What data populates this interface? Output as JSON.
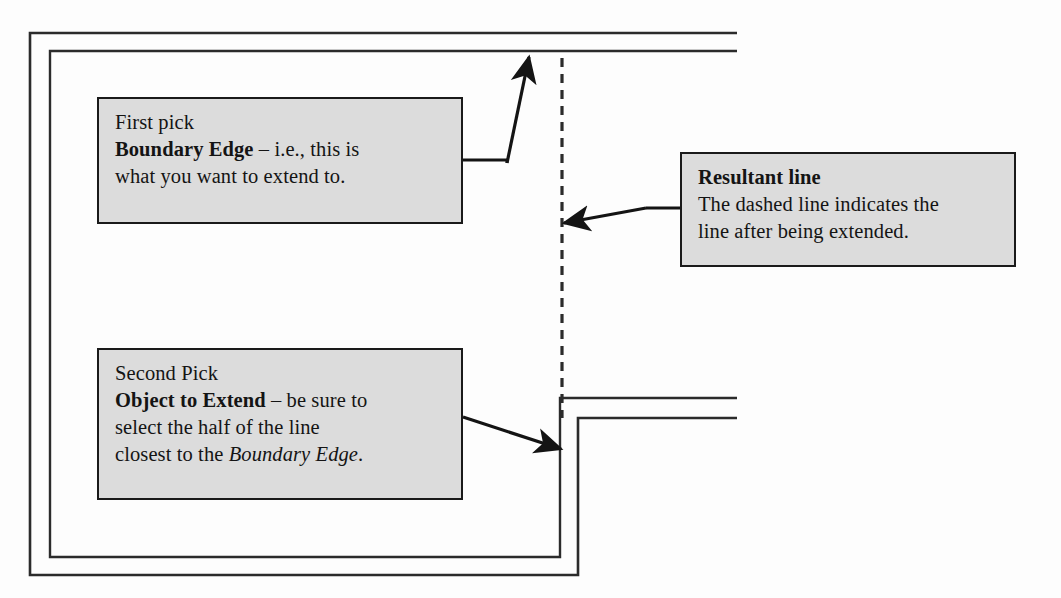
{
  "diagram": {
    "background_color": "#fdfdfd",
    "line_color": "#1a1a1a",
    "callout_fill": "#dcdcdc"
  },
  "callouts": {
    "first_pick": {
      "name": "first-pick-callout",
      "line1": "First pick",
      "line2_bold": "Boundary Edge",
      "line2_rest": " – i.e., this is",
      "line3": "what you want to extend to."
    },
    "second_pick": {
      "name": "second-pick-callout",
      "line1": "Second Pick",
      "line2_bold": "Object to Extend",
      "line2_rest": " – be sure to",
      "line3": "select the half of the line",
      "line4_pre": "closest to the ",
      "line4_italic": "Boundary Edge",
      "line4_post": "."
    },
    "resultant": {
      "name": "resultant-line-callout",
      "line1_bold": "Resultant line",
      "line2": "The dashed line indicates the",
      "line3": "line after being extended."
    }
  },
  "geometry": {
    "outer_frame": {
      "left": 30,
      "top": 33,
      "right": 578,
      "bottom": 575
    },
    "inner_frame": {
      "left": 50,
      "top": 51,
      "right": 560,
      "bottom": 557
    },
    "top_wall_right_end": 737,
    "lower_wall_top_y": 398,
    "lower_wall_bottom_y": 418,
    "dashed_line": {
      "x": 562,
      "y_start": 58,
      "y_end": 418,
      "dash": 9,
      "gap": 7
    }
  }
}
